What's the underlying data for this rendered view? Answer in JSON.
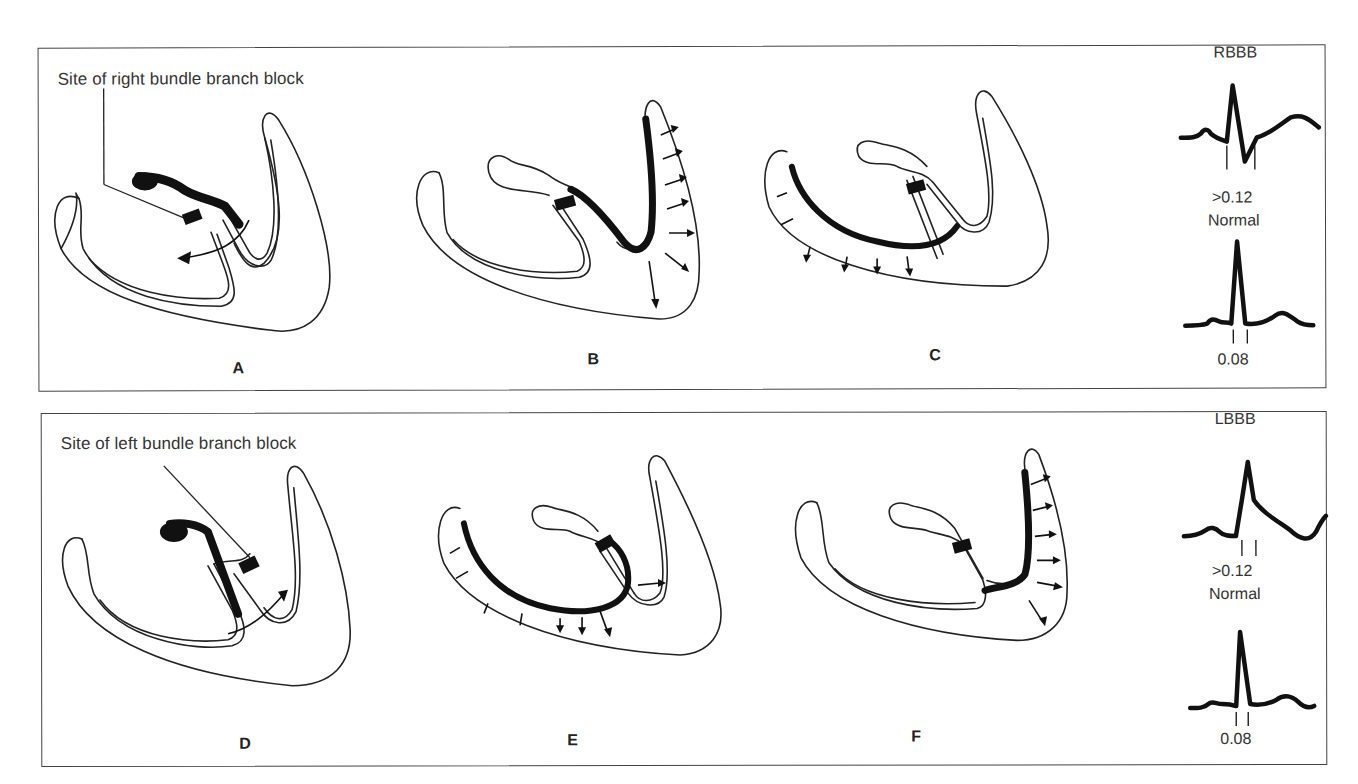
{
  "figure": {
    "top_row": {
      "callout": "Site of right bundle branch block",
      "panels": [
        {
          "letter": "A",
          "description": "Right bundle branch blocked; impulse travels down left bundle, arrow crosses septum from left to right"
        },
        {
          "letter": "B",
          "description": "Left ventricle depolarized via left bundle (dark), arrows radiate outward from left ventricular wall"
        },
        {
          "letter": "C",
          "description": "Right ventricle depolarized late (dark), arrows through right ventricular wall"
        }
      ],
      "ecg": {
        "block_label": "RBBB",
        "block_duration": ">0.12",
        "normal_label": "Normal",
        "normal_duration": "0.08"
      }
    },
    "bottom_row": {
      "callout": "Site of left bundle branch block",
      "panels": [
        {
          "letter": "D",
          "description": "Left bundle branch blocked; impulse travels down right bundle, arrow crosses septum from right to left"
        },
        {
          "letter": "E",
          "description": "Right ventricle depolarized first via right bundle (dark), arrows radiate through right ventricular wall"
        },
        {
          "letter": "F",
          "description": "Left ventricle depolarized late (dark), arrows through left ventricular wall"
        }
      ],
      "ecg": {
        "block_label": "LBBB",
        "block_duration": ">0.12",
        "normal_label": "Normal",
        "normal_duration": "0.08"
      }
    }
  },
  "colors": {
    "ink": "#111111",
    "border": "#444444",
    "background": "#ffffff"
  }
}
